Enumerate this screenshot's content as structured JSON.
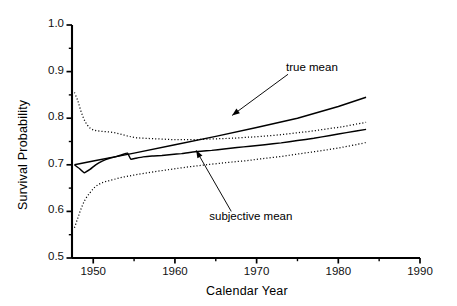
{
  "chart_data": {
    "type": "line",
    "title": "",
    "xlabel": "Calendar Year",
    "ylabel": "Survival Probability",
    "xlim": [
      1947.4,
      1990.0
    ],
    "ylim": [
      0.5,
      1.0
    ],
    "xticks": [
      1950,
      1960,
      1970,
      1980,
      1990
    ],
    "xtick_labels": [
      "1950",
      "1960",
      "1970",
      "1980",
      "1990"
    ],
    "x_minor_ticks": [
      1955,
      1965,
      1975,
      1985
    ],
    "yticks": [
      0.5,
      0.6,
      0.7,
      0.8,
      0.9,
      1.0
    ],
    "ytick_labels": [
      "0.5",
      "0.6",
      "0.7",
      "0.8",
      "0.9",
      "1.0"
    ],
    "y_minor_ticks": [
      0.55,
      0.65,
      0.75,
      0.85,
      0.95
    ],
    "grid": false,
    "legend": "none",
    "annotations": [
      {
        "name": "true-mean",
        "text": "true mean",
        "text_x": 1973.6,
        "text_y": 0.905,
        "arrow_to_x": 1967.0,
        "arrow_to_y": 0.806
      },
      {
        "name": "subjective-mean",
        "text": "subjective mean",
        "text_x": 1964.2,
        "text_y": 0.585,
        "arrow_to_x": 1962.6,
        "arrow_to_y": 0.731
      }
    ],
    "series": [
      {
        "name": "true mean",
        "style": "solid",
        "color": "#000000",
        "x": [
          1947.7,
          1950,
          1955,
          1960,
          1965,
          1970,
          1975,
          1980,
          1983.4
        ],
        "values": [
          0.7,
          0.708,
          0.725,
          0.743,
          0.761,
          0.78,
          0.8,
          0.825,
          0.845
        ]
      },
      {
        "name": "subjective mean",
        "style": "solid",
        "color": "#000000",
        "x": [
          1947.7,
          1948.3,
          1948.9,
          1949.6,
          1950.3,
          1951.1,
          1952.0,
          1952.9,
          1953.6,
          1954.2,
          1954.6,
          1955.2,
          1956.1,
          1957.2,
          1958.4,
          1959.6,
          1960.8,
          1962.0,
          1963.2,
          1964.5,
          1966.0,
          1967.6,
          1969.2,
          1971.0,
          1973.0,
          1975.0,
          1977.0,
          1979.0,
          1981.0,
          1983.4
        ],
        "values": [
          0.7,
          0.692,
          0.683,
          0.69,
          0.7,
          0.708,
          0.714,
          0.718,
          0.722,
          0.725,
          0.712,
          0.714,
          0.717,
          0.719,
          0.72,
          0.722,
          0.724,
          0.727,
          0.729,
          0.731,
          0.734,
          0.737,
          0.74,
          0.743,
          0.747,
          0.752,
          0.757,
          0.763,
          0.769,
          0.776
        ]
      },
      {
        "name": "upper confidence band",
        "style": "dotted",
        "color": "#000000",
        "x": [
          1947.7,
          1948.1,
          1948.5,
          1949.0,
          1949.6,
          1950.2,
          1950.9,
          1951.7,
          1952.6,
          1953.5,
          1954.4,
          1955.3,
          1956.3,
          1957.4,
          1958.6,
          1959.8,
          1961.0,
          1962.4,
          1963.8,
          1965.4,
          1967.0,
          1968.8,
          1970.6,
          1972.6,
          1974.6,
          1976.6,
          1978.6,
          1980.6,
          1982.4,
          1983.4
        ],
        "values": [
          0.855,
          0.838,
          0.815,
          0.793,
          0.779,
          0.774,
          0.772,
          0.771,
          0.769,
          0.765,
          0.761,
          0.758,
          0.757,
          0.756,
          0.755,
          0.754,
          0.754,
          0.754,
          0.755,
          0.756,
          0.757,
          0.759,
          0.761,
          0.764,
          0.768,
          0.772,
          0.777,
          0.782,
          0.788,
          0.791
        ]
      },
      {
        "name": "lower confidence band",
        "style": "dotted",
        "color": "#000000",
        "x": [
          1947.7,
          1948.1,
          1948.5,
          1949.0,
          1949.6,
          1950.2,
          1950.9,
          1951.7,
          1952.6,
          1953.5,
          1954.4,
          1955.3,
          1956.3,
          1957.4,
          1958.6,
          1959.8,
          1961.0,
          1962.4,
          1963.8,
          1965.4,
          1967.0,
          1968.8,
          1970.6,
          1972.6,
          1974.6,
          1976.6,
          1978.6,
          1980.6,
          1982.4,
          1983.4
        ],
        "values": [
          0.565,
          0.585,
          0.605,
          0.625,
          0.64,
          0.652,
          0.66,
          0.665,
          0.669,
          0.673,
          0.676,
          0.679,
          0.682,
          0.685,
          0.688,
          0.691,
          0.694,
          0.697,
          0.7,
          0.703,
          0.706,
          0.709,
          0.713,
          0.717,
          0.722,
          0.727,
          0.732,
          0.738,
          0.744,
          0.748
        ]
      }
    ]
  }
}
